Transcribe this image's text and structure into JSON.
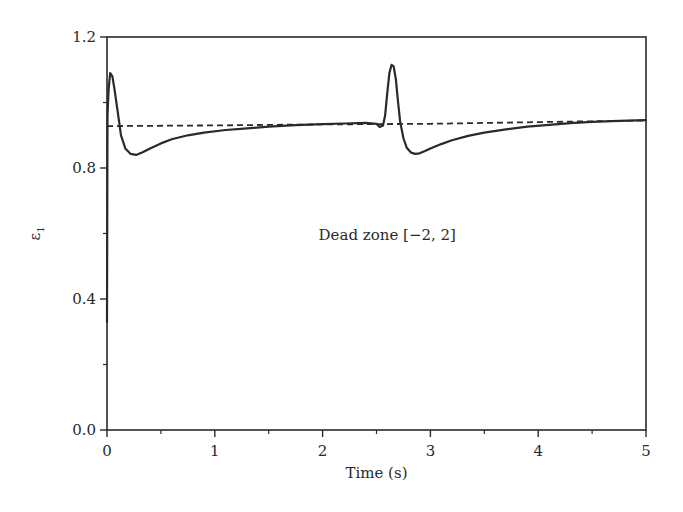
{
  "chart_data": {
    "type": "line",
    "title": "",
    "xlabel": "Time (s)",
    "ylabel": "ε",
    "ylabel_subscript": "1",
    "xlim": [
      0,
      5
    ],
    "ylim": [
      0.0,
      1.2
    ],
    "x_ticks": [
      0,
      1,
      2,
      3,
      4,
      5
    ],
    "x_tick_labels": [
      "0",
      "1",
      "2",
      "3",
      "4",
      "5"
    ],
    "x_minor_ticks": [
      0.5,
      1.5,
      2.5,
      3.5,
      4.5
    ],
    "y_ticks": [
      0.0,
      0.4,
      0.8,
      1.2
    ],
    "y_tick_labels": [
      "0.0",
      "0.4",
      "0.8",
      "1.2"
    ],
    "y_minor_ticks": [
      0.2,
      0.6,
      1.0
    ],
    "grid": false,
    "legend": null,
    "annotations": [
      {
        "text": "Dead zone [−2, 2]",
        "x": 2.6,
        "y": 0.58
      }
    ],
    "series": [
      {
        "name": "actual",
        "style": "solid",
        "color": "#2a2a2a",
        "x": [
          0,
          0.005,
          0.015,
          0.03,
          0.05,
          0.07,
          0.1,
          0.13,
          0.17,
          0.22,
          0.27,
          0.33,
          0.4,
          0.5,
          0.6,
          0.75,
          0.9,
          1.1,
          1.3,
          1.5,
          1.75,
          2.0,
          2.2,
          2.4,
          2.5,
          2.53,
          2.56,
          2.58,
          2.6,
          2.62,
          2.64,
          2.66,
          2.68,
          2.7,
          2.72,
          2.75,
          2.78,
          2.82,
          2.86,
          2.9,
          2.95,
          3.0,
          3.1,
          3.2,
          3.35,
          3.5,
          3.7,
          3.9,
          4.1,
          4.3,
          4.5,
          4.75,
          5.0
        ],
        "y": [
          0.33,
          0.96,
          1.04,
          1.09,
          1.08,
          1.04,
          0.97,
          0.9,
          0.86,
          0.843,
          0.84,
          0.848,
          0.86,
          0.875,
          0.888,
          0.9,
          0.908,
          0.916,
          0.921,
          0.926,
          0.931,
          0.934,
          0.936,
          0.938,
          0.935,
          0.925,
          0.93,
          0.96,
          1.03,
          1.09,
          1.115,
          1.11,
          1.07,
          1.0,
          0.94,
          0.89,
          0.862,
          0.847,
          0.843,
          0.845,
          0.852,
          0.86,
          0.873,
          0.885,
          0.898,
          0.908,
          0.918,
          0.926,
          0.932,
          0.937,
          0.941,
          0.944,
          0.946
        ]
      },
      {
        "name": "reference",
        "style": "dashed",
        "color": "#2a2a2a",
        "x": [
          0,
          1,
          2,
          3,
          4,
          5
        ],
        "y": [
          0.928,
          0.93,
          0.933,
          0.935,
          0.94,
          0.945
        ]
      }
    ]
  }
}
